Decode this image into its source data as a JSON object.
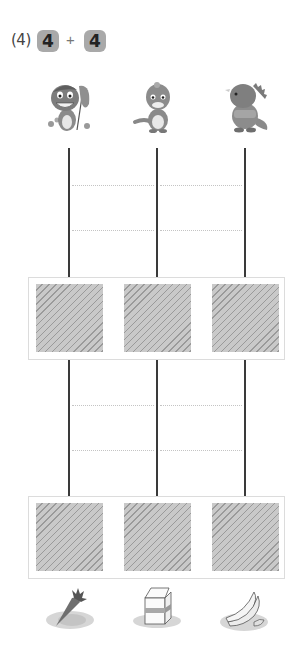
{
  "problem": {
    "label": "(4)",
    "operand_a": "4",
    "operator": "+",
    "operand_b": "4"
  },
  "characters": [
    {
      "name": "dinosaur-with-net",
      "icon": "dino-net-icon"
    },
    {
      "name": "baby-dinosaur",
      "icon": "dino-baby-icon"
    },
    {
      "name": "rhino-dinosaur",
      "icon": "dino-rhino-icon"
    }
  ],
  "ladder": {
    "columns_x": [
      69,
      157,
      245
    ],
    "section_1_dotted_y": [
      185,
      230
    ],
    "section_2_dotted_y": [
      405,
      450
    ]
  },
  "answer_rows": [
    {
      "boxes": [
        "",
        "",
        ""
      ]
    },
    {
      "boxes": [
        "",
        "",
        ""
      ]
    }
  ],
  "foods": [
    {
      "name": "carrot",
      "icon": "carrot-icon"
    },
    {
      "name": "milk-carton",
      "icon": "milk-carton-icon"
    },
    {
      "name": "bananas",
      "icon": "banana-icon"
    }
  ],
  "colors": {
    "badge_bg": "#a9a9a9",
    "line": "#3a3a3a",
    "dotted": "#c4c4c4",
    "hatch_light": "#c9c9c9",
    "hatch_dark": "#9a9a9a",
    "frame": "#dcdcdc"
  }
}
